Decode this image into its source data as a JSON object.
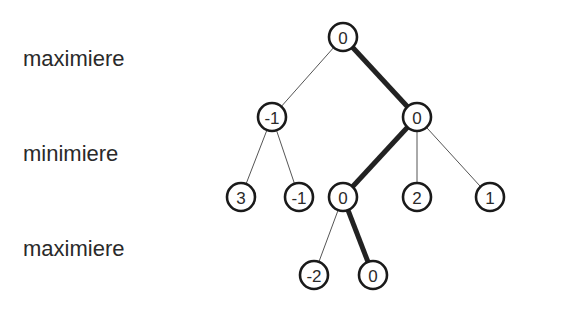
{
  "levels": [
    {
      "label": "maximiere",
      "y": 48
    },
    {
      "label": "minimiere",
      "y": 143
    },
    {
      "label": "maximiere",
      "y": 238
    }
  ],
  "tree": {
    "nodes": [
      {
        "id": "root",
        "value": "0",
        "x": 343,
        "y": 37
      },
      {
        "id": "a",
        "value": "-1",
        "x": 272,
        "y": 117
      },
      {
        "id": "b",
        "value": "0",
        "x": 417,
        "y": 117
      },
      {
        "id": "a1",
        "value": "3",
        "x": 241,
        "y": 197
      },
      {
        "id": "a2",
        "value": "-1",
        "x": 299,
        "y": 197
      },
      {
        "id": "b1",
        "value": "0",
        "x": 343,
        "y": 197
      },
      {
        "id": "b2",
        "value": "2",
        "x": 417,
        "y": 197
      },
      {
        "id": "b3",
        "value": "1",
        "x": 490,
        "y": 197
      },
      {
        "id": "b1a",
        "value": "-2",
        "x": 314,
        "y": 275
      },
      {
        "id": "b1b",
        "value": "0",
        "x": 373,
        "y": 275
      }
    ],
    "edges": [
      {
        "from": "root",
        "to": "a",
        "best": false
      },
      {
        "from": "root",
        "to": "b",
        "best": true
      },
      {
        "from": "a",
        "to": "a1",
        "best": false
      },
      {
        "from": "a",
        "to": "a2",
        "best": false
      },
      {
        "from": "b",
        "to": "b1",
        "best": true
      },
      {
        "from": "b",
        "to": "b2",
        "best": false
      },
      {
        "from": "b",
        "to": "b3",
        "best": false
      },
      {
        "from": "b1",
        "to": "b1a",
        "best": false
      },
      {
        "from": "b1",
        "to": "b1b",
        "best": true
      }
    ]
  }
}
